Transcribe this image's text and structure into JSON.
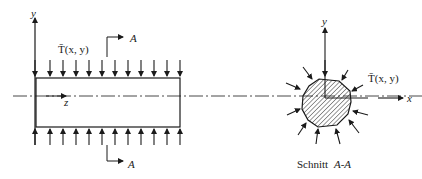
{
  "figure": {
    "longitudinal_view": {
      "y_axis_label": "y",
      "z_axis_label": "z",
      "load_label": "T̄(x, y)",
      "section_marker_top": "A",
      "section_marker_bottom": "A",
      "top_load_arrow_count": 11,
      "bottom_load_arrow_count": 12
    },
    "cross_section": {
      "y_axis_label": "y",
      "x_axis_label": "x",
      "load_label": "T̄(x, y)",
      "caption_word": "Schnitt",
      "caption_section": "A-A"
    },
    "colors": {
      "ink": "#1a1a1a",
      "background": "#ffffff"
    }
  }
}
